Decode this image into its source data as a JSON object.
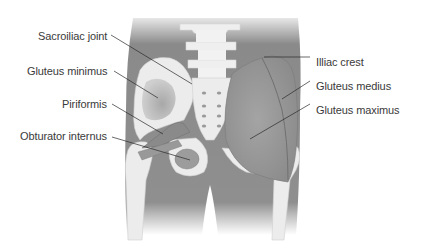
{
  "diagram": {
    "colors": {
      "background": "#ffffff",
      "body_silhouette": "#8e8e8e",
      "bone": "#ececec",
      "muscle": "#9a9a9a",
      "leader_line": "#2a2a2a",
      "label_text": "#3a3a3a"
    },
    "labels_left": [
      {
        "text": "Sacroiliac joint",
        "x": 38,
        "y": 30
      },
      {
        "text": "Gluteus minimus",
        "x": 27,
        "y": 65
      },
      {
        "text": "Piriformis",
        "x": 62,
        "y": 98
      },
      {
        "text": "Obturator internus",
        "x": 20,
        "y": 130
      }
    ],
    "labels_right": [
      {
        "text": "Illiac crest",
        "x": 316,
        "y": 56
      },
      {
        "text": "Gluteus medius",
        "x": 316,
        "y": 80
      },
      {
        "text": "Gluteus maximus",
        "x": 316,
        "y": 104
      }
    ]
  }
}
